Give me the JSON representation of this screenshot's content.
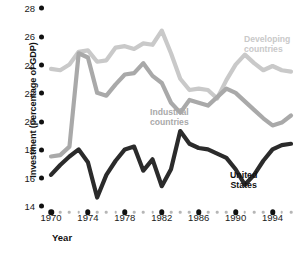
{
  "chart_data": {
    "type": "line",
    "title": "",
    "xlabel": "Year",
    "ylabel": "Investment (percentage of GDP)",
    "xlim": [
      1970,
      1996
    ],
    "ylim": [
      14,
      28
    ],
    "ytick_values": [
      14,
      16,
      18,
      20,
      22,
      24,
      26,
      28
    ],
    "ytick_labels": [
      "14",
      "16",
      "18",
      "20",
      "22",
      "24",
      "26",
      "28"
    ],
    "xtick_values": [
      1970,
      1974,
      1978,
      1982,
      1986,
      1990,
      1994
    ],
    "xtick_labels": [
      "1970",
      "1974",
      "1978",
      "1982",
      "1986",
      "1990",
      "1994"
    ],
    "x": [
      1970,
      1971,
      1972,
      1973,
      1974,
      1975,
      1976,
      1977,
      1978,
      1979,
      1980,
      1981,
      1982,
      1983,
      1984,
      1985,
      1986,
      1987,
      1988,
      1989,
      1990,
      1991,
      1992,
      1993,
      1994,
      1995,
      1996
    ],
    "grid": false,
    "legend_position": "inline-annotations",
    "series": [
      {
        "name": "Developing countries",
        "color": "#c9c9c9",
        "values": [
          23.7,
          23.6,
          24.0,
          24.9,
          25.0,
          24.2,
          24.3,
          25.2,
          25.3,
          25.1,
          25.5,
          25.4,
          26.4,
          24.8,
          23.0,
          22.2,
          22.3,
          22.2,
          21.6,
          22.9,
          24.0,
          24.7,
          24.1,
          23.6,
          23.9,
          23.6,
          23.5
        ]
      },
      {
        "name": "Industrial countries",
        "color": "#a9a9a9",
        "values": [
          17.5,
          17.6,
          18.2,
          24.8,
          24.5,
          22.0,
          21.8,
          22.6,
          23.3,
          23.4,
          24.1,
          23.2,
          22.7,
          21.3,
          20.6,
          21.5,
          21.3,
          21.1,
          21.7,
          22.3,
          22.0,
          21.4,
          20.8,
          20.2,
          19.7,
          19.9,
          20.4
        ]
      },
      {
        "name": "United States",
        "color": "#2b2b2b",
        "values": [
          16.2,
          16.9,
          17.5,
          18.0,
          17.1,
          14.6,
          16.2,
          17.2,
          18.0,
          18.2,
          16.5,
          17.3,
          15.4,
          16.6,
          19.3,
          18.4,
          18.1,
          18.0,
          17.7,
          17.4,
          16.6,
          15.5,
          16.2,
          17.2,
          18.0,
          18.3,
          18.4
        ]
      }
    ]
  },
  "axis": {
    "y_title": "Investment (percentage of GDP)",
    "x_title": "Year"
  },
  "annotations": {
    "developing_line1": "Developing",
    "developing_line2": "countries",
    "industrial_line1": "Industrial",
    "industrial_line2": "countries",
    "us_line1": "United",
    "us_line2": "States"
  }
}
